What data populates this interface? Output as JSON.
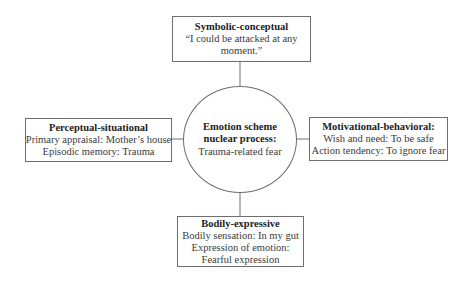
{
  "diagram": {
    "center": {
      "title_lines": [
        "Emotion scheme",
        "nuclear process:"
      ],
      "body_lines": [
        "Trauma-related fear"
      ]
    },
    "top": {
      "title": "Symbolic-conceptual",
      "body_lines": [
        "“I could be attacked at any",
        "moment.”"
      ]
    },
    "left": {
      "title": "Perceptual-situational",
      "body_lines": [
        "Primary appraisal: Mother’s house",
        "Episodic memory: Trauma"
      ]
    },
    "right": {
      "title": "Motivational-behavioral:",
      "body_lines": [
        "Wish and need: To be safe",
        "Action tendency: To ignore fear"
      ]
    },
    "bottom": {
      "title": "Bodily-expressive",
      "body_lines": [
        "Bodily sensation: In my gut",
        "Expression of emotion:",
        "Fearful expression"
      ]
    },
    "colors": {
      "border": "#6e6e6e",
      "text": "#333333",
      "background": "#ffffff"
    }
  }
}
